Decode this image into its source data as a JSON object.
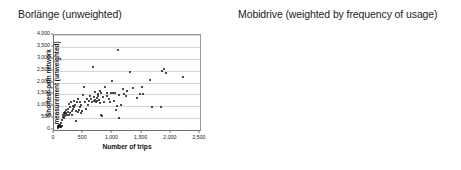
{
  "figure": {
    "background": "#ffffff",
    "dot_color": "#111111",
    "grid_color": "#d5d5d5",
    "axis_color": "#6e6e6e"
  },
  "panels": [
    {
      "id": "left",
      "title": "Borlänge (unweighted)"
    },
    {
      "id": "right",
      "title": "Mobidrive (weighted by frequency of usage)"
    }
  ],
  "chart_data": [
    {
      "type": "scatter",
      "title": "Borlänge (unweighted)",
      "xlabel": "Number of trips",
      "ylabel": "Shortest-path network measurement (unweighted)",
      "ylabel_lines": [
        "Shortest-path network",
        "measurement (unweighted)"
      ],
      "xlim": [
        0,
        2500
      ],
      "ylim": [
        0,
        4000
      ],
      "xticks": [
        0,
        500,
        1000,
        1500,
        2000,
        2500
      ],
      "xticklabels": [
        "0",
        "500",
        "1,000",
        "1,500",
        "2,000",
        "2,500"
      ],
      "yticks": [
        0,
        500,
        1000,
        1500,
        2000,
        2500,
        3000,
        3500,
        4000
      ],
      "yticklabels": [
        "0",
        "500",
        "1,000",
        "1,500",
        "2,000",
        "2,500",
        "3,000",
        "3,500",
        "4,000"
      ],
      "grid": true,
      "grid_axis": "y",
      "legend": false,
      "points": [
        [
          60,
          120
        ],
        [
          70,
          150
        ],
        [
          75,
          95
        ],
        [
          85,
          175
        ],
        [
          90,
          210
        ],
        [
          95,
          130
        ],
        [
          100,
          165
        ],
        [
          110,
          230
        ],
        [
          115,
          120
        ],
        [
          120,
          300
        ],
        [
          130,
          185
        ],
        [
          140,
          420
        ],
        [
          150,
          560
        ],
        [
          160,
          640
        ],
        [
          165,
          500
        ],
        [
          175,
          700
        ],
        [
          180,
          600
        ],
        [
          190,
          760
        ],
        [
          195,
          660
        ],
        [
          200,
          830
        ],
        [
          210,
          700
        ],
        [
          225,
          640
        ],
        [
          235,
          880
        ],
        [
          245,
          760
        ],
        [
          250,
          1090
        ],
        [
          260,
          620
        ],
        [
          270,
          700
        ],
        [
          280,
          960
        ],
        [
          290,
          1180
        ],
        [
          300,
          800
        ],
        [
          310,
          620
        ],
        [
          320,
          1010
        ],
        [
          330,
          890
        ],
        [
          340,
          1210
        ],
        [
          350,
          960
        ],
        [
          360,
          1060
        ],
        [
          370,
          390
        ],
        [
          385,
          820
        ],
        [
          395,
          1200
        ],
        [
          405,
          770
        ],
        [
          415,
          1290
        ],
        [
          430,
          860
        ],
        [
          440,
          1180
        ],
        [
          450,
          980
        ],
        [
          460,
          710
        ],
        [
          470,
          1060
        ],
        [
          480,
          820
        ],
        [
          495,
          1480
        ],
        [
          510,
          1790
        ],
        [
          525,
          1160
        ],
        [
          540,
          900
        ],
        [
          560,
          1320
        ],
        [
          575,
          1050
        ],
        [
          600,
          1230
        ],
        [
          615,
          1420
        ],
        [
          630,
          1310
        ],
        [
          650,
          1180
        ],
        [
          665,
          2660
        ],
        [
          680,
          1220
        ],
        [
          690,
          1370
        ],
        [
          700,
          1250
        ],
        [
          710,
          1600
        ],
        [
          720,
          1180
        ],
        [
          730,
          1330
        ],
        [
          740,
          1210
        ],
        [
          750,
          1520
        ],
        [
          760,
          1430
        ],
        [
          770,
          1280
        ],
        [
          780,
          1630
        ],
        [
          790,
          1150
        ],
        [
          800,
          620
        ],
        [
          810,
          1560
        ],
        [
          820,
          610
        ],
        [
          840,
          1380
        ],
        [
          860,
          1160
        ],
        [
          880,
          1790
        ],
        [
          900,
          1430
        ],
        [
          915,
          1540
        ],
        [
          940,
          1300
        ],
        [
          960,
          1180
        ],
        [
          980,
          1570
        ],
        [
          1000,
          2060
        ],
        [
          1010,
          1540
        ],
        [
          1020,
          1240
        ],
        [
          1040,
          1560
        ],
        [
          1060,
          860
        ],
        [
          1080,
          1030
        ],
        [
          1100,
          3380
        ],
        [
          1110,
          500
        ],
        [
          1120,
          1460
        ],
        [
          1150,
          1060
        ],
        [
          1180,
          1720
        ],
        [
          1200,
          1530
        ],
        [
          1230,
          1420
        ],
        [
          1250,
          1640
        ],
        [
          1300,
          2430
        ],
        [
          1350,
          1750
        ],
        [
          1420,
          1360
        ],
        [
          1470,
          1500
        ],
        [
          1500,
          1810
        ],
        [
          1520,
          1510
        ],
        [
          1650,
          2110
        ],
        [
          1680,
          960
        ],
        [
          1830,
          960
        ],
        [
          1850,
          2500
        ],
        [
          1880,
          2550
        ],
        [
          1920,
          2400
        ],
        [
          2210,
          2250
        ]
      ]
    },
    {
      "type": "scatter",
      "title": "Mobidrive (weighted by frequency of usage)",
      "xlabel": "Number of unique locations",
      "ylabel": "Shortest-path network measurement (weighted by frequency)",
      "ylabel_lines": [
        "Shortest-path network",
        "measurement",
        "(weighted by frequency)"
      ],
      "xlim": [
        0,
        80
      ],
      "ylim": [
        0,
        900
      ],
      "xticks": [
        0,
        20,
        40,
        60,
        80
      ],
      "xticklabels": [
        "0",
        "20",
        "40",
        "60",
        "80"
      ],
      "yticks": [
        0,
        100,
        200,
        300,
        400,
        500,
        600,
        700,
        800,
        900
      ],
      "yticklabels": [
        "0",
        "100",
        "200",
        "300",
        "400",
        "500",
        "600",
        "700",
        "800",
        "900"
      ],
      "grid": true,
      "grid_axis": "y",
      "legend": false,
      "points": [
        [
          5,
          30
        ],
        [
          6,
          35
        ],
        [
          7,
          70
        ],
        [
          8,
          25
        ],
        [
          8,
          60
        ],
        [
          9,
          95
        ],
        [
          10,
          80
        ],
        [
          10,
          130
        ],
        [
          11,
          110
        ],
        [
          11,
          65
        ],
        [
          12,
          150
        ],
        [
          12,
          90
        ],
        [
          13,
          120
        ],
        [
          13,
          175
        ],
        [
          14,
          100
        ],
        [
          14,
          145
        ],
        [
          15,
          115
        ],
        [
          15,
          185
        ],
        [
          15,
          75
        ],
        [
          16,
          160
        ],
        [
          16,
          210
        ],
        [
          16,
          100
        ],
        [
          17,
          130
        ],
        [
          17,
          190
        ],
        [
          17,
          250
        ],
        [
          18,
          110
        ],
        [
          18,
          165
        ],
        [
          18,
          225
        ],
        [
          19,
          140
        ],
        [
          19,
          195
        ],
        [
          19,
          265
        ],
        [
          20,
          120
        ],
        [
          20,
          175
        ],
        [
          20,
          230
        ],
        [
          20,
          290
        ],
        [
          21,
          150
        ],
        [
          21,
          205
        ],
        [
          21,
          145
        ],
        [
          22,
          130
        ],
        [
          22,
          185
        ],
        [
          22,
          245
        ],
        [
          22,
          310
        ],
        [
          23,
          160
        ],
        [
          23,
          215
        ],
        [
          23,
          175
        ],
        [
          24,
          140
        ],
        [
          24,
          200
        ],
        [
          24,
          265
        ],
        [
          24,
          330
        ],
        [
          25,
          170
        ],
        [
          25,
          225
        ],
        [
          25,
          150
        ],
        [
          25,
          295
        ],
        [
          26,
          185
        ],
        [
          26,
          240
        ],
        [
          26,
          135
        ],
        [
          26,
          420
        ],
        [
          27,
          160
        ],
        [
          27,
          210
        ],
        [
          27,
          280
        ],
        [
          27,
          325
        ],
        [
          28,
          190
        ],
        [
          28,
          245
        ],
        [
          28,
          155
        ],
        [
          28,
          300
        ],
        [
          29,
          175
        ],
        [
          29,
          230
        ],
        [
          29,
          290
        ],
        [
          29,
          120
        ],
        [
          30,
          200
        ],
        [
          30,
          260
        ],
        [
          30,
          340
        ],
        [
          30,
          165
        ],
        [
          31,
          215
        ],
        [
          31,
          280
        ],
        [
          31,
          180
        ],
        [
          31,
          395
        ],
        [
          32,
          230
        ],
        [
          32,
          300
        ],
        [
          32,
          150
        ],
        [
          32,
          255
        ],
        [
          33,
          210
        ],
        [
          33,
          275
        ],
        [
          33,
          355
        ],
        [
          33,
          185
        ],
        [
          34,
          240
        ],
        [
          34,
          310
        ],
        [
          34,
          160
        ],
        [
          35,
          225
        ],
        [
          35,
          290
        ],
        [
          35,
          380
        ],
        [
          35,
          435
        ],
        [
          36,
          250
        ],
        [
          36,
          330
        ],
        [
          36,
          200
        ],
        [
          36,
          410
        ],
        [
          37,
          270
        ],
        [
          37,
          350
        ],
        [
          37,
          175
        ],
        [
          37,
          300
        ],
        [
          38,
          240
        ],
        [
          38,
          320
        ],
        [
          38,
          420
        ],
        [
          38,
          195
        ],
        [
          39,
          280
        ],
        [
          39,
          360
        ],
        [
          39,
          230
        ],
        [
          40,
          300
        ],
        [
          40,
          390
        ],
        [
          40,
          250
        ],
        [
          40,
          185
        ],
        [
          41,
          320
        ],
        [
          41,
          420
        ],
        [
          41,
          270
        ],
        [
          42,
          340
        ],
        [
          42,
          450
        ],
        [
          42,
          290
        ],
        [
          42,
          515
        ],
        [
          43,
          360
        ],
        [
          43,
          230
        ],
        [
          43,
          390
        ],
        [
          44,
          310
        ],
        [
          44,
          420
        ],
        [
          44,
          480
        ],
        [
          45,
          340
        ],
        [
          45,
          280
        ],
        [
          45,
          440
        ],
        [
          46,
          370
        ],
        [
          46,
          490
        ],
        [
          47,
          330
        ],
        [
          47,
          420
        ],
        [
          48,
          460
        ],
        [
          48,
          350
        ],
        [
          49,
          500
        ],
        [
          49,
          390
        ],
        [
          50,
          605
        ],
        [
          50,
          440
        ],
        [
          51,
          545
        ],
        [
          52,
          320
        ],
        [
          53,
          410
        ],
        [
          55,
          680
        ],
        [
          55,
          600
        ],
        [
          56,
          450
        ],
        [
          61,
          845
        ],
        [
          61,
          425
        ],
        [
          67,
          490
        ]
      ]
    }
  ]
}
